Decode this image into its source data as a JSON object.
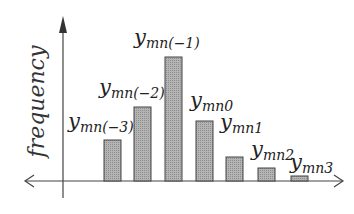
{
  "chart_data": {
    "type": "bar",
    "title": "",
    "xlabel": "",
    "ylabel": "frequency",
    "categories": [
      "y_mn(-3)",
      "y_mn(-2)",
      "y_mn(-1)",
      "y_mn0",
      "y_mn1",
      "y_mn2",
      "y_mn3"
    ],
    "values": [
      41,
      74,
      124,
      60,
      24,
      13,
      5
    ],
    "grid": false,
    "legend": null,
    "bar_color": "#a8a8a8",
    "bar_edge_color": "#444444"
  },
  "axis": {
    "ylabel": "frequency"
  },
  "labels": [
    {
      "main": "y",
      "sub": "mn(−3)"
    },
    {
      "main": "y",
      "sub": "mn(−2)"
    },
    {
      "main": "y",
      "sub": "mn(−1)"
    },
    {
      "main": "y",
      "sub": "mn0"
    },
    {
      "main": "y",
      "sub": "mn1"
    },
    {
      "main": "y",
      "sub": "mn2"
    },
    {
      "main": "y",
      "sub": "mn3"
    }
  ]
}
